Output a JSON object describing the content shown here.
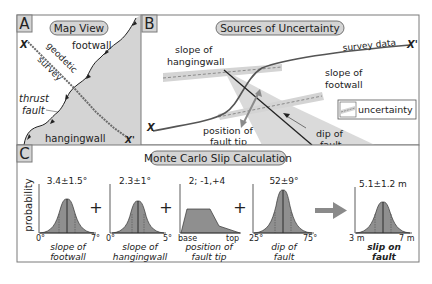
{
  "panel_a": {
    "letter": "A",
    "title": "Map View",
    "labels": {
      "x_start": "X",
      "x_end": "X'",
      "footwall": "footwall",
      "hangingwall": "hangingwall",
      "survey_1": "geodetic",
      "survey_2": "survey",
      "thrust_1": "thrust",
      "thrust_2": "fault"
    }
  },
  "panel_b": {
    "letter": "B",
    "title": "Sources of Uncertainty",
    "labels": {
      "x_start": "X",
      "x_end": "X'",
      "survey_data": "survey data",
      "slope_hw_1": "slope of",
      "slope_hw_2": "hangingwall",
      "slope_fw_1": "slope of",
      "slope_fw_2": "footwall",
      "tip_1": "position of",
      "tip_2": "fault tip",
      "dip_1": "dip of",
      "dip_2": "fault",
      "legend": "uncertainty"
    }
  },
  "panel_c": {
    "letter": "C",
    "title": "Monte Carlo Slip Calculation",
    "y_label": "probability",
    "operators": [
      "+",
      "+",
      "+"
    ],
    "charts": [
      {
        "value": "3.4±1.5°",
        "min": "0°",
        "max": "7°",
        "label_1": "slope of",
        "label_2": "footwall"
      },
      {
        "value": "2.3±1°",
        "min": "0°",
        "max": "5°",
        "label_1": "slope of",
        "label_2": "hangingwall"
      },
      {
        "value": "2; -1,+4",
        "min": "base",
        "max": "top",
        "label_1": "position of",
        "label_2": "fault tip"
      },
      {
        "value": "52±9°",
        "min": "25°",
        "max": "75°",
        "label_1": "dip of",
        "label_2": "fault"
      },
      {
        "value": "5.1±1.2 m",
        "min": "3 m",
        "max": "7 m",
        "label_1": "slip on",
        "label_2": "fault"
      }
    ]
  },
  "colors": {
    "frame": "#7a7a7a",
    "fill_gray": "#d4d4d4",
    "curve_fill": "#8f8f8f",
    "line": "#333333",
    "survey": "#6b6b6b",
    "arrow": "#8a8a8a"
  }
}
